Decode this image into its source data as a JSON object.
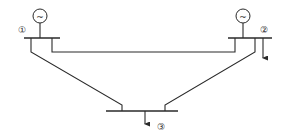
{
  "diagram": {
    "type": "three-bus power system one-line diagram",
    "buses": [
      {
        "id": 1,
        "label": "①",
        "has_generator": true,
        "has_load": false
      },
      {
        "id": 2,
        "label": "②",
        "has_generator": true,
        "has_load": true
      },
      {
        "id": 3,
        "label": "③",
        "has_generator": false,
        "has_load": true
      }
    ],
    "generator_symbol": "~",
    "lines": [
      {
        "from": 1,
        "to": 2
      },
      {
        "from": 1,
        "to": 3
      },
      {
        "from": 2,
        "to": 3
      }
    ],
    "colors": {
      "stroke": "#2a2a2a",
      "background": "#ffffff"
    }
  }
}
